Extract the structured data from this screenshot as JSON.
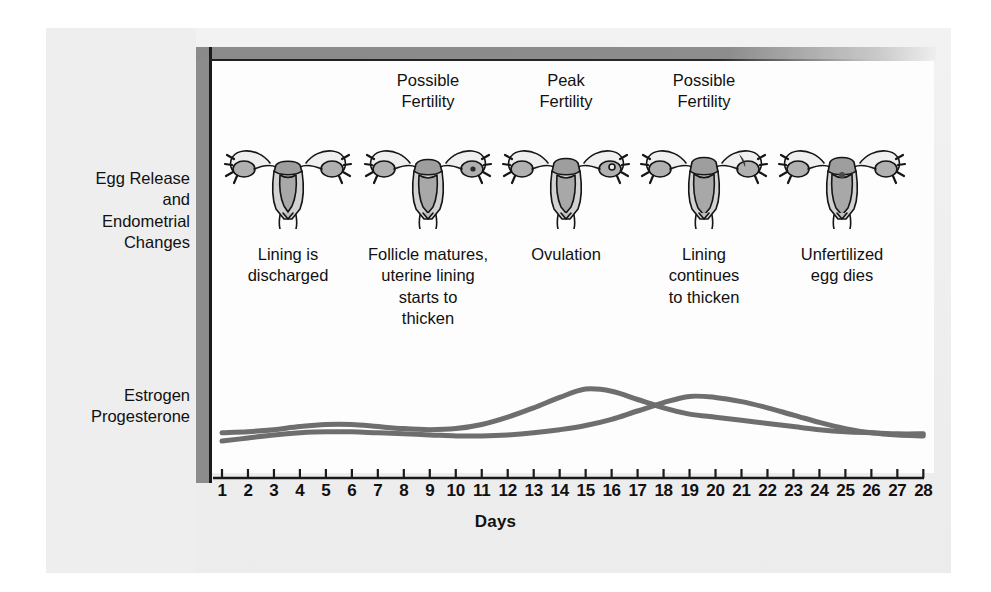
{
  "figure": {
    "row_labels": [
      {
        "id": "egg-release",
        "text": "Egg Release\nand\nEndometrial\nChanges"
      },
      {
        "id": "hormones",
        "text": "Estrogen\nProgesterone"
      }
    ],
    "phases": [
      {
        "header": "",
        "caption": "Lining is\ndischarged",
        "icon": "uterus-icon"
      },
      {
        "header": "Possible\nFertility",
        "caption": "Follicle matures,\nuterine lining\nstarts to\nthicken",
        "icon": "uterus-icon"
      },
      {
        "header": "Peak\nFertility",
        "caption": "Ovulation",
        "icon": "uterus-icon"
      },
      {
        "header": "Possible\nFertility",
        "caption": "Lining\ncontinues\nto thicken",
        "icon": "uterus-icon"
      },
      {
        "header": "",
        "caption": "Unfertilized\negg dies",
        "icon": "uterus-icon"
      }
    ],
    "axis_title": "Days",
    "colors": {
      "frame_gray": "#8c8c8c",
      "frame_black": "#1a1a1a",
      "curve_gray": "#6e6e6e",
      "organ_fill": "#b5b5b5",
      "organ_light": "#d6d6d6",
      "paper": "#efefef"
    }
  },
  "chart_data": {
    "type": "line",
    "xlabel": "Days",
    "ylabel": "",
    "x": [
      1,
      2,
      3,
      4,
      5,
      6,
      7,
      8,
      9,
      10,
      11,
      12,
      13,
      14,
      15,
      16,
      17,
      18,
      19,
      20,
      21,
      22,
      23,
      24,
      25,
      26,
      27,
      28
    ],
    "xlim": [
      1,
      28
    ],
    "ylim": [
      0,
      100
    ],
    "grid": false,
    "legend_position": "left-outside",
    "series": [
      {
        "name": "Estrogen",
        "values": [
          30,
          31,
          33,
          36,
          38,
          38,
          36,
          34,
          33,
          34,
          38,
          45,
          54,
          64,
          72,
          70,
          62,
          54,
          48,
          45,
          42,
          39,
          36,
          33,
          31,
          30,
          29,
          29
        ]
      },
      {
        "name": "Progesterone",
        "values": [
          22,
          25,
          28,
          30,
          31,
          31,
          30,
          29,
          28,
          27,
          27,
          28,
          30,
          33,
          37,
          43,
          51,
          59,
          65,
          64,
          60,
          54,
          47,
          40,
          34,
          30,
          28,
          27
        ]
      }
    ],
    "annotations": [
      {
        "x": 8,
        "text": "Possible Fertility"
      },
      {
        "x": 14,
        "text": "Peak Fertility"
      },
      {
        "x": 19,
        "text": "Possible Fertility"
      }
    ]
  }
}
